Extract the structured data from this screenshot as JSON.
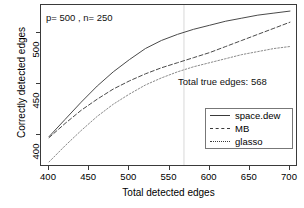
{
  "chart_data": {
    "type": "line",
    "title": "",
    "xlabel": "Total detected edges",
    "ylabel": "Correctly detected edges",
    "xlim": [
      390,
      710
    ],
    "ylim": [
      368,
      528
    ],
    "xticks": [
      400,
      450,
      500,
      550,
      600,
      650,
      700
    ],
    "yticks": [
      400,
      450,
      500
    ],
    "grid": false,
    "legend_position": "bottom-right",
    "annotations": [
      {
        "name": "params",
        "text": "p= 500 , n= 250",
        "x": 412,
        "y": 517
      },
      {
        "name": "total-true-edges",
        "text": "Total true edges: 568",
        "x": 575,
        "y": 461
      }
    ],
    "reference_lines": [
      {
        "name": "total-true-edges-vline",
        "orientation": "vertical",
        "x": 568,
        "color": "#d8d8d8"
      }
    ],
    "x": [
      400,
      420,
      440,
      460,
      480,
      500,
      520,
      540,
      560,
      580,
      600,
      620,
      640,
      660,
      680,
      700
    ],
    "series": [
      {
        "name": "space.dew",
        "style": "solid",
        "color": "#4a4a4a",
        "values": [
          398,
          415,
          432,
          448,
          462,
          474,
          485,
          493,
          499,
          504,
          508,
          512,
          515,
          518,
          520,
          522
        ]
      },
      {
        "name": "MB",
        "style": "dashed",
        "color": "#4a4a4a",
        "values": [
          397,
          411,
          424,
          435,
          445,
          453,
          460,
          466,
          471,
          476,
          481,
          487,
          493,
          499,
          505,
          511
        ]
      },
      {
        "name": "glasso",
        "style": "dotted",
        "color": "#8a8a8a",
        "values": [
          373,
          389,
          404,
          418,
          430,
          440,
          449,
          456,
          462,
          467,
          471,
          475,
          479,
          482,
          485,
          487
        ]
      }
    ]
  },
  "axes": {
    "x_tick_labels": [
      "400",
      "450",
      "500",
      "550",
      "600",
      "650",
      "700"
    ],
    "y_tick_labels": [
      "400",
      "450",
      "500"
    ],
    "x_title": "Total detected edges",
    "y_title": "Correctly detected edges"
  },
  "legend": {
    "entries": [
      {
        "label": "space.dew",
        "style": "solid"
      },
      {
        "label": "MB",
        "style": "dashed"
      },
      {
        "label": "glasso",
        "style": "dotted"
      }
    ]
  },
  "colors": {
    "frame": "#3a3a3a",
    "solid_line": "#4a4a4a",
    "dashed_line": "#4a4a4a",
    "dotted_line": "#8a8a8a",
    "reference_line": "#d8d8d8",
    "background": "#ffffff"
  }
}
